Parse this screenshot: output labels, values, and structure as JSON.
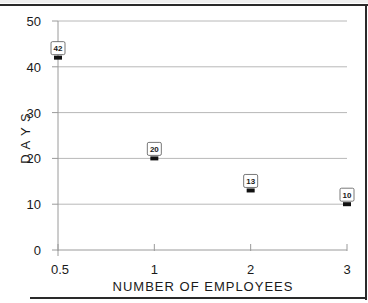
{
  "chart_data": {
    "type": "scatter",
    "title": "",
    "xlabel": "NUMBER OF EMPLOYEES",
    "ylabel": "D A Y S",
    "categories": [
      "0.5",
      "1",
      "2",
      "3"
    ],
    "x": [
      0.5,
      1,
      2,
      3
    ],
    "values": [
      42,
      20,
      13,
      10
    ],
    "data_labels": [
      "42",
      "20",
      "13",
      "10"
    ],
    "y_ticks": [
      "0",
      "10",
      "20",
      "30",
      "40",
      "50"
    ],
    "ylim": [
      0,
      50
    ],
    "x_scale": "categorical (evenly spaced)",
    "grid": "horizontal",
    "legend": "none",
    "marker": "black rectangle with boxed data label above"
  }
}
